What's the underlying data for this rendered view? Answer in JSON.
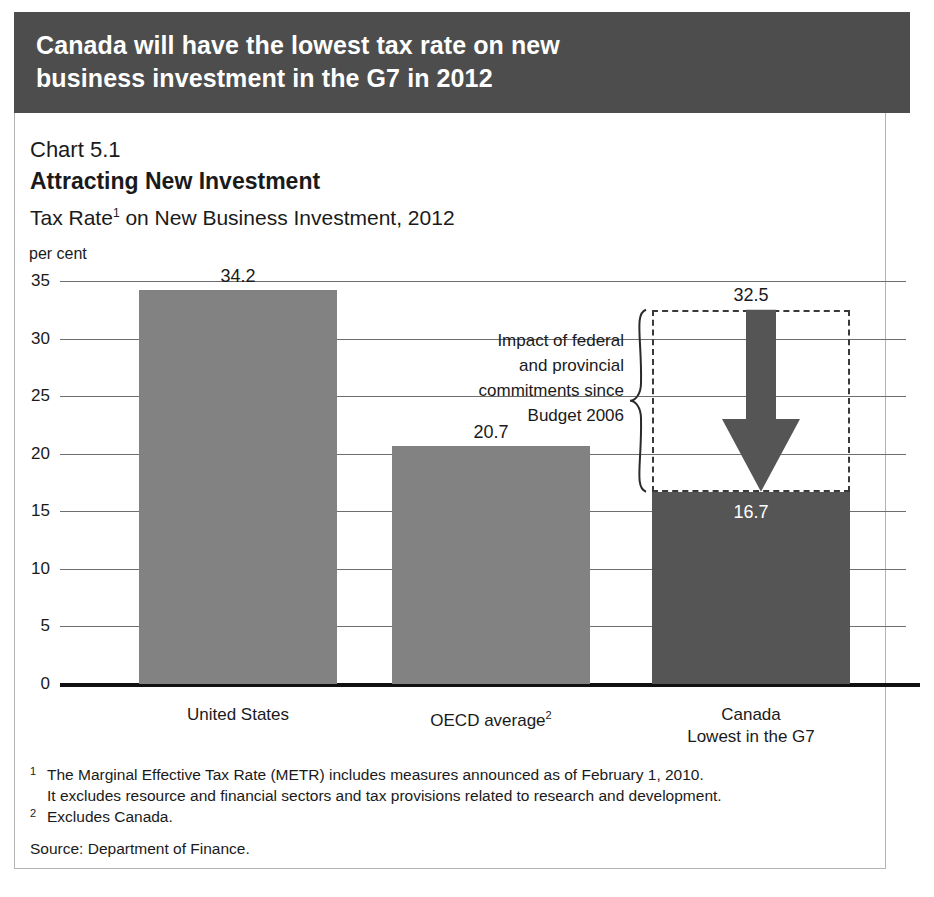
{
  "header": {
    "line1": "Canada will have the lowest tax rate on new",
    "line2": "business investment in the G7 in 2012",
    "background_color": "#4d4d4d",
    "text_color": "#ffffff"
  },
  "chart_number": "Chart 5.1",
  "chart_title": "Attracting New Investment",
  "chart_subtitle_pre": "Tax Rate",
  "chart_subtitle_sup": "1",
  "chart_subtitle_post": " on New Business Investment, 2012",
  "axis_unit": "per cent",
  "annotation": {
    "line1": "Impact of federal",
    "line2": "and provincial",
    "line3": "commitments since",
    "line4": "Budget 2006"
  },
  "footnotes": {
    "fn1_marker": "1",
    "fn1_line1": "The Marginal Effective Tax Rate (METR) includes measures announced as of February 1, 2010.",
    "fn1_line2": "It excludes resource and financial sectors and tax provisions related to research and development.",
    "fn2_marker": "2",
    "fn2_line1": "Excludes Canada.",
    "source": "Source: Department of Finance."
  },
  "chart_data": {
    "type": "bar",
    "title": "Attracting New Investment",
    "subtitle": "Tax Rate on New Business Investment, 2012",
    "xlabel": "",
    "ylabel": "per cent",
    "ylim": [
      0,
      35
    ],
    "yticks": [
      0,
      5,
      10,
      15,
      20,
      25,
      30,
      35
    ],
    "ytick_labels": [
      "0",
      "5",
      "10",
      "15",
      "20",
      "25",
      "30",
      "35"
    ],
    "grid": true,
    "legend": "none",
    "categories": [
      "United States",
      "OECD average²",
      "Canada\nLowest in the G7"
    ],
    "category_labels": [
      {
        "line1": "United States",
        "sup": ""
      },
      {
        "line1": "OECD average",
        "sup": "2"
      },
      {
        "line1": "Canada",
        "line2": "Lowest in the G7",
        "sup": ""
      }
    ],
    "values": [
      34.2,
      20.7,
      16.7
    ],
    "value_labels": [
      "34.2",
      "20.7",
      "16.7"
    ],
    "bar_colors": [
      "#828282",
      "#828282",
      "#555555"
    ],
    "annotations": [
      {
        "label": "32.5",
        "value": 32.5,
        "description": "Canada rate before federal and provincial commitments since Budget 2006",
        "applies_to": "Canada"
      },
      {
        "label": "Impact of federal and provincial commitments since Budget 2006",
        "from": 32.5,
        "to": 16.7,
        "applies_to": "Canada"
      }
    ]
  }
}
